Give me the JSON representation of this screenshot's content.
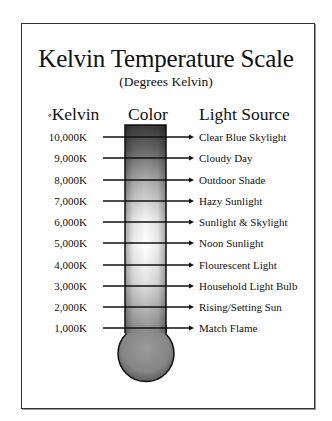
{
  "title": "Kelvin Temperature Scale",
  "subtitle": "(Degrees Kelvin)",
  "headers": {
    "kelvin_degree_mark": "º",
    "kelvin": "Kelvin",
    "color": "Color",
    "light_source": "Light Source"
  },
  "scale": [
    {
      "kelvin": "10,000K",
      "source": "Clear Blue Skylight"
    },
    {
      "kelvin": "9,000K",
      "source": "Cloudy Day"
    },
    {
      "kelvin": "8,000K",
      "source": "Outdoor Shade"
    },
    {
      "kelvin": "7,000K",
      "source": "Hazy Sunlight"
    },
    {
      "kelvin": "6,000K",
      "source": "Sunlight & Skylight"
    },
    {
      "kelvin": "5,000K",
      "source": "Noon Sunlight"
    },
    {
      "kelvin": "4,000K",
      "source": "Flourescent Light"
    },
    {
      "kelvin": "3,000K",
      "source": "Household Light Bulb"
    },
    {
      "kelvin": "2,000K",
      "source": "Rising/Setting Sun"
    },
    {
      "kelvin": "1,000K",
      "source": "Match Flame"
    }
  ],
  "colors": {
    "frame_border": "#333333",
    "tube_top": "#3a3a3a",
    "tube_mid": "#ffffff",
    "bulb": "#8a8a8a",
    "text": "#111111"
  }
}
